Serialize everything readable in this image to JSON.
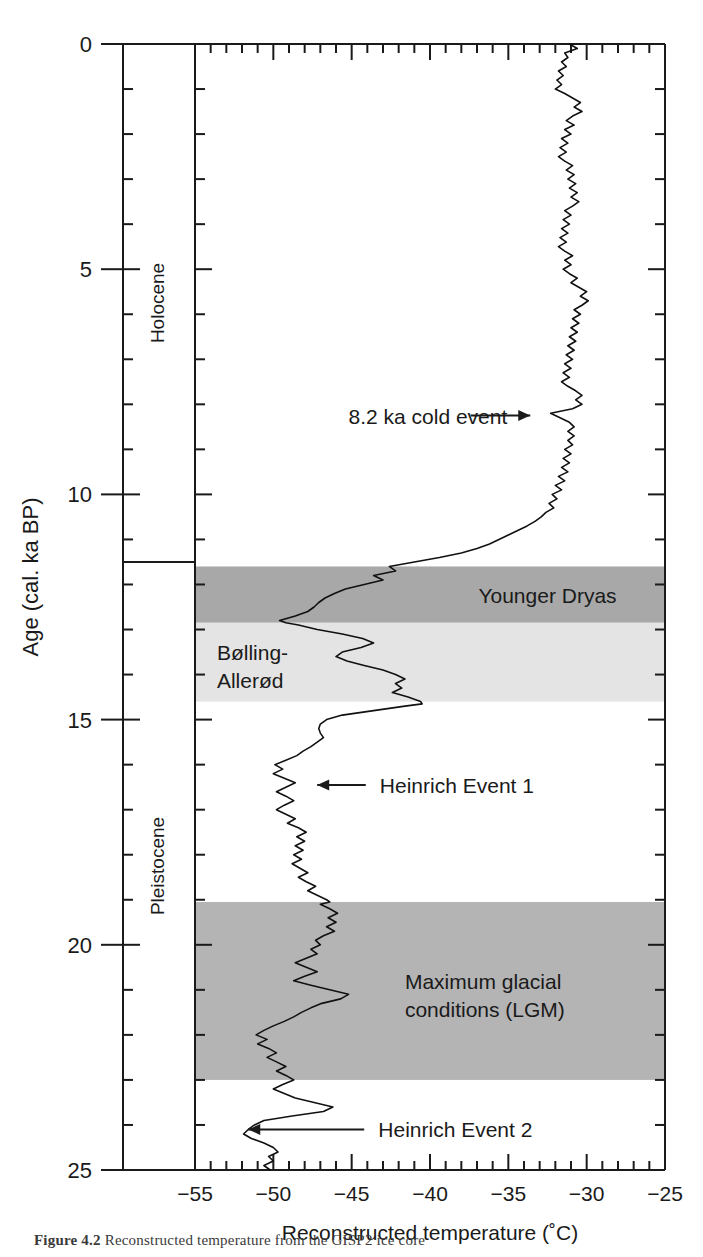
{
  "figure": {
    "caption_label": "Figure 4.2",
    "caption_rest": "Reconstructed temperature from the GISP2 ice core"
  },
  "axes": {
    "y": {
      "label": "Age (cal. ka BP)",
      "ticks_major": [
        0,
        5,
        10,
        15,
        20,
        25
      ],
      "tick_labels": [
        "0",
        "5",
        "10",
        "15",
        "20",
        "25"
      ],
      "minor_step": 1,
      "range": [
        0,
        25
      ],
      "direction": "increasing-downward"
    },
    "x": {
      "label": "Reconstructed temperature (˚C)",
      "ticks_major": [
        -55,
        -50,
        -45,
        -40,
        -35,
        -30,
        -25
      ],
      "tick_labels": [
        "−55",
        "−50",
        "−45",
        "−40",
        "−35",
        "−30",
        "−25"
      ],
      "minor_step": 1,
      "range": [
        -55,
        -25
      ]
    }
  },
  "epoch_column": {
    "name": "geologic-epoch-column",
    "boundary_age": 11.5,
    "epochs": [
      {
        "label": "Holocene",
        "from": 0,
        "to": 11.5
      },
      {
        "label": "Pleistocene",
        "from": 11.5,
        "to": 25
      }
    ]
  },
  "bands": [
    {
      "label": "Younger Dryas",
      "from": 11.6,
      "to": 12.85,
      "shade": "#a8a8a8",
      "label_x": -32.5,
      "label_anchor": "middle",
      "show_label": true
    },
    {
      "label": "Bølling-",
      "label2": "Allerød",
      "from": 12.85,
      "to": 14.6,
      "shade": "#e4e4e4",
      "label_x": -53.6,
      "label_anchor": "start",
      "show_label": true
    },
    {
      "label": "Maximum glacial",
      "label2": "conditions (LGM)",
      "from": 19.05,
      "to": 23.0,
      "shade": "#b4b4b4",
      "label_x": -41.6,
      "label_anchor": "start",
      "show_label": true
    }
  ],
  "annotations": [
    {
      "name": "annotation-8-2-ka",
      "text": "8.2 ka cold event",
      "age": 8.25,
      "text_x": -45.2,
      "anchor": "start",
      "arrow": {
        "from_x": -37.4,
        "to_x": -33.6,
        "direction": "right"
      }
    },
    {
      "name": "annotation-heinrich-1",
      "text": "Heinrich Event 1",
      "age": 16.45,
      "text_x": -43.2,
      "anchor": "start",
      "arrow": {
        "from_x": -44.1,
        "to_x": -47.2,
        "direction": "left"
      }
    },
    {
      "name": "annotation-heinrich-2",
      "text": "Heinrich Event 2",
      "age": 24.1,
      "text_x": -43.3,
      "anchor": "start",
      "arrow": {
        "from_x": -44.2,
        "to_x": -51.6,
        "direction": "left"
      }
    }
  ],
  "colors": {
    "axis": "#1a1a1a",
    "curve": "#111111",
    "band_dark": "#a8a8a8",
    "band_mid": "#b4b4b4",
    "band_light": "#e4e4e4",
    "background": "#ffffff"
  },
  "chart_data": {
    "type": "line",
    "title": "",
    "xlabel": "Reconstructed temperature (˚C)",
    "ylabel": "Age (cal. ka BP)",
    "xlim": [
      -55,
      -25
    ],
    "ylim": [
      0,
      25
    ],
    "y_inverted": true,
    "grid": false,
    "legend": "none",
    "series": [
      {
        "name": "Reconstructed temperature",
        "x_is_value": true,
        "points_note": "pairs of [age_ka, temperature_C]",
        "points": [
          [
            0.0,
            -31.1
          ],
          [
            0.1,
            -30.6
          ],
          [
            0.2,
            -31.4
          ],
          [
            0.3,
            -31.2
          ],
          [
            0.4,
            -31.6
          ],
          [
            0.5,
            -31.3
          ],
          [
            0.6,
            -31.8
          ],
          [
            0.7,
            -31.5
          ],
          [
            0.8,
            -31.9
          ],
          [
            0.9,
            -31.6
          ],
          [
            1.0,
            -32.0
          ],
          [
            1.1,
            -31.4
          ],
          [
            1.2,
            -30.9
          ],
          [
            1.3,
            -30.4
          ],
          [
            1.4,
            -30.8
          ],
          [
            1.5,
            -30.3
          ],
          [
            1.6,
            -30.9
          ],
          [
            1.7,
            -31.3
          ],
          [
            1.8,
            -30.8
          ],
          [
            1.9,
            -31.4
          ],
          [
            2.0,
            -31.0
          ],
          [
            2.1,
            -31.6
          ],
          [
            2.2,
            -31.2
          ],
          [
            2.3,
            -31.7
          ],
          [
            2.4,
            -31.3
          ],
          [
            2.5,
            -31.8
          ],
          [
            2.6,
            -31.4
          ],
          [
            2.7,
            -30.9
          ],
          [
            2.8,
            -31.3
          ],
          [
            2.9,
            -30.8
          ],
          [
            3.0,
            -31.2
          ],
          [
            3.1,
            -30.7
          ],
          [
            3.2,
            -31.1
          ],
          [
            3.3,
            -30.6
          ],
          [
            3.4,
            -31.0
          ],
          [
            3.5,
            -30.5
          ],
          [
            3.6,
            -30.9
          ],
          [
            3.7,
            -31.4
          ],
          [
            3.8,
            -31.0
          ],
          [
            3.9,
            -31.5
          ],
          [
            4.0,
            -31.1
          ],
          [
            4.1,
            -31.6
          ],
          [
            4.2,
            -31.2
          ],
          [
            4.3,
            -31.7
          ],
          [
            4.4,
            -31.3
          ],
          [
            4.5,
            -31.8
          ],
          [
            4.6,
            -31.4
          ],
          [
            4.7,
            -30.9
          ],
          [
            4.8,
            -31.4
          ],
          [
            4.9,
            -31.0
          ],
          [
            5.0,
            -31.5
          ],
          [
            5.1,
            -31.1
          ],
          [
            5.2,
            -30.6
          ],
          [
            5.3,
            -31.0
          ],
          [
            5.4,
            -30.5
          ],
          [
            5.5,
            -30.0
          ],
          [
            5.6,
            -30.4
          ],
          [
            5.7,
            -29.9
          ],
          [
            5.8,
            -30.3
          ],
          [
            5.9,
            -30.8
          ],
          [
            6.0,
            -30.4
          ],
          [
            6.1,
            -30.9
          ],
          [
            6.2,
            -30.5
          ],
          [
            6.3,
            -31.0
          ],
          [
            6.4,
            -30.6
          ],
          [
            6.5,
            -31.1
          ],
          [
            6.6,
            -30.7
          ],
          [
            6.7,
            -31.2
          ],
          [
            6.8,
            -30.8
          ],
          [
            6.9,
            -31.3
          ],
          [
            7.0,
            -30.9
          ],
          [
            7.1,
            -31.4
          ],
          [
            7.2,
            -31.0
          ],
          [
            7.3,
            -31.5
          ],
          [
            7.4,
            -31.1
          ],
          [
            7.5,
            -31.6
          ],
          [
            7.6,
            -31.2
          ],
          [
            7.7,
            -30.7
          ],
          [
            7.8,
            -30.3
          ],
          [
            7.9,
            -30.7
          ],
          [
            8.0,
            -30.3
          ],
          [
            8.1,
            -30.9
          ],
          [
            8.2,
            -32.3
          ],
          [
            8.3,
            -31.7
          ],
          [
            8.4,
            -31.1
          ],
          [
            8.5,
            -30.8
          ],
          [
            8.6,
            -31.2
          ],
          [
            8.7,
            -30.8
          ],
          [
            8.8,
            -31.2
          ],
          [
            8.9,
            -30.9
          ],
          [
            9.0,
            -31.4
          ],
          [
            9.1,
            -31.0
          ],
          [
            9.2,
            -31.5
          ],
          [
            9.3,
            -31.1
          ],
          [
            9.4,
            -31.6
          ],
          [
            9.5,
            -31.2
          ],
          [
            9.6,
            -31.8
          ],
          [
            9.7,
            -31.4
          ],
          [
            9.8,
            -32.0
          ],
          [
            9.9,
            -31.6
          ],
          [
            10.0,
            -32.2
          ],
          [
            10.1,
            -31.9
          ],
          [
            10.2,
            -32.4
          ],
          [
            10.3,
            -32.1
          ],
          [
            10.4,
            -32.6
          ],
          [
            10.5,
            -32.9
          ],
          [
            10.6,
            -33.3
          ],
          [
            10.7,
            -33.8
          ],
          [
            10.8,
            -34.4
          ],
          [
            10.9,
            -35.0
          ],
          [
            11.0,
            -35.6
          ],
          [
            11.1,
            -36.2
          ],
          [
            11.2,
            -37.0
          ],
          [
            11.3,
            -38.0
          ],
          [
            11.4,
            -39.4
          ],
          [
            11.5,
            -41.0
          ],
          [
            11.6,
            -42.6
          ],
          [
            11.7,
            -42.2
          ],
          [
            11.8,
            -43.6
          ],
          [
            11.9,
            -43.0
          ],
          [
            12.0,
            -44.2
          ],
          [
            12.1,
            -45.4
          ],
          [
            12.2,
            -46.1
          ],
          [
            12.3,
            -46.7
          ],
          [
            12.4,
            -47.1
          ],
          [
            12.5,
            -47.4
          ],
          [
            12.6,
            -47.8
          ],
          [
            12.7,
            -48.6
          ],
          [
            12.8,
            -49.6
          ],
          [
            12.85,
            -49.2
          ],
          [
            12.9,
            -48.4
          ],
          [
            13.0,
            -47.2
          ],
          [
            13.1,
            -45.6
          ],
          [
            13.2,
            -44.3
          ],
          [
            13.3,
            -43.6
          ],
          [
            13.4,
            -44.4
          ],
          [
            13.5,
            -45.6
          ],
          [
            13.6,
            -46.0
          ],
          [
            13.7,
            -45.3
          ],
          [
            13.8,
            -44.2
          ],
          [
            13.9,
            -43.0
          ],
          [
            14.0,
            -42.2
          ],
          [
            14.1,
            -41.6
          ],
          [
            14.2,
            -42.2
          ],
          [
            14.3,
            -41.8
          ],
          [
            14.4,
            -42.4
          ],
          [
            14.5,
            -41.4
          ],
          [
            14.6,
            -40.6
          ],
          [
            14.65,
            -40.5
          ],
          [
            14.7,
            -41.6
          ],
          [
            14.8,
            -43.6
          ],
          [
            14.9,
            -45.6
          ],
          [
            15.0,
            -46.6
          ],
          [
            15.1,
            -47.0
          ],
          [
            15.2,
            -47.1
          ],
          [
            15.3,
            -47.0
          ],
          [
            15.4,
            -46.8
          ],
          [
            15.5,
            -47.2
          ],
          [
            15.6,
            -47.6
          ],
          [
            15.7,
            -48.1
          ],
          [
            15.8,
            -48.5
          ],
          [
            15.9,
            -49.2
          ],
          [
            16.0,
            -49.9
          ],
          [
            16.1,
            -49.4
          ],
          [
            16.2,
            -50.0
          ],
          [
            16.3,
            -49.3
          ],
          [
            16.4,
            -48.6
          ],
          [
            16.5,
            -49.2
          ],
          [
            16.6,
            -49.8
          ],
          [
            16.7,
            -49.2
          ],
          [
            16.8,
            -48.7
          ],
          [
            16.9,
            -49.3
          ],
          [
            17.0,
            -49.8
          ],
          [
            17.1,
            -49.2
          ],
          [
            17.2,
            -48.6
          ],
          [
            17.3,
            -49.1
          ],
          [
            17.4,
            -48.4
          ],
          [
            17.5,
            -47.9
          ],
          [
            17.6,
            -48.5
          ],
          [
            17.7,
            -48.0
          ],
          [
            17.8,
            -48.6
          ],
          [
            17.9,
            -48.1
          ],
          [
            18.0,
            -48.7
          ],
          [
            18.1,
            -48.2
          ],
          [
            18.2,
            -48.8
          ],
          [
            18.3,
            -48.3
          ],
          [
            18.4,
            -47.8
          ],
          [
            18.5,
            -48.4
          ],
          [
            18.6,
            -47.9
          ],
          [
            18.7,
            -47.3
          ],
          [
            18.8,
            -47.8
          ],
          [
            18.9,
            -47.2
          ],
          [
            19.0,
            -46.6
          ],
          [
            19.05,
            -46.4
          ],
          [
            19.1,
            -47.0
          ],
          [
            19.2,
            -46.4
          ],
          [
            19.3,
            -45.9
          ],
          [
            19.4,
            -46.5
          ],
          [
            19.5,
            -46.0
          ],
          [
            19.6,
            -46.6
          ],
          [
            19.7,
            -46.1
          ],
          [
            19.8,
            -46.8
          ],
          [
            19.9,
            -47.3
          ],
          [
            20.0,
            -47.0
          ],
          [
            20.1,
            -47.6
          ],
          [
            20.2,
            -47.2
          ],
          [
            20.3,
            -47.9
          ],
          [
            20.4,
            -48.6
          ],
          [
            20.5,
            -47.9
          ],
          [
            20.6,
            -47.2
          ],
          [
            20.7,
            -48.0
          ],
          [
            20.8,
            -48.7
          ],
          [
            20.9,
            -47.6
          ],
          [
            21.0,
            -46.4
          ],
          [
            21.1,
            -45.2
          ],
          [
            21.2,
            -45.7
          ],
          [
            21.3,
            -46.9
          ],
          [
            21.4,
            -47.6
          ],
          [
            21.5,
            -48.2
          ],
          [
            21.6,
            -48.7
          ],
          [
            21.7,
            -49.3
          ],
          [
            21.8,
            -50.0
          ],
          [
            21.9,
            -50.6
          ],
          [
            22.0,
            -51.1
          ],
          [
            22.1,
            -50.4
          ],
          [
            22.2,
            -51.0
          ],
          [
            22.3,
            -50.3
          ],
          [
            22.4,
            -49.8
          ],
          [
            22.5,
            -50.4
          ],
          [
            22.6,
            -49.8
          ],
          [
            22.7,
            -49.2
          ],
          [
            22.8,
            -49.8
          ],
          [
            22.9,
            -49.2
          ],
          [
            23.0,
            -48.7
          ],
          [
            23.1,
            -49.4
          ],
          [
            23.2,
            -50.0
          ],
          [
            23.3,
            -49.3
          ],
          [
            23.4,
            -48.6
          ],
          [
            23.5,
            -47.4
          ],
          [
            23.6,
            -46.2
          ],
          [
            23.7,
            -46.8
          ],
          [
            23.8,
            -48.8
          ],
          [
            23.9,
            -50.6
          ],
          [
            24.0,
            -51.2
          ],
          [
            24.1,
            -51.6
          ],
          [
            24.2,
            -51.9
          ],
          [
            24.3,
            -51.4
          ],
          [
            24.4,
            -50.6
          ],
          [
            24.5,
            -50.0
          ],
          [
            24.6,
            -49.7
          ],
          [
            24.7,
            -50.3
          ],
          [
            24.8,
            -50.0
          ],
          [
            24.9,
            -50.6
          ],
          [
            25.0,
            -50.2
          ]
        ]
      }
    ],
    "annotations": [
      {
        "text": "8.2 ka cold event",
        "age": 8.2
      },
      {
        "text": "Younger Dryas",
        "age_range": [
          11.6,
          12.85
        ]
      },
      {
        "text": "Bølling-Allerød",
        "age_range": [
          12.85,
          14.6
        ]
      },
      {
        "text": "Heinrich Event 1",
        "age": 16.45
      },
      {
        "text": "Maximum glacial conditions (LGM)",
        "age_range": [
          19.05,
          23.0
        ]
      },
      {
        "text": "Heinrich Event 2",
        "age": 24.1
      }
    ]
  }
}
